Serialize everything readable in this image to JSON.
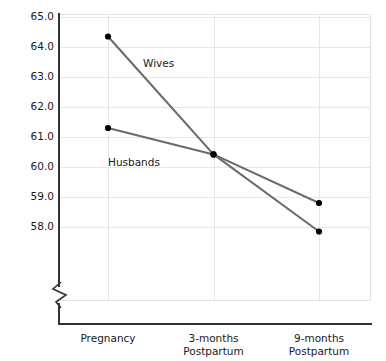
{
  "chart_data": {
    "type": "line",
    "title": "",
    "xlabel": "",
    "ylabel": "Mean Score:  Marital Satisfaction",
    "categories": [
      "Pregnancy",
      "3-months Postpartum",
      "9-months Postpartum"
    ],
    "category_lines": [
      [
        "Pregnancy",
        ""
      ],
      [
        "3-months",
        "Postpartum"
      ],
      [
        "9-months",
        "Postpartum"
      ]
    ],
    "ylim": [
      57.0,
      65.0
    ],
    "yticks": [
      65.0,
      64.0,
      63.0,
      62.0,
      61.0,
      60.0,
      59.0,
      58.0
    ],
    "ytick_labels": [
      "65.0",
      "64.0",
      "63.0",
      "62.0",
      "61.0",
      "60.0",
      "59.0",
      "58.0"
    ],
    "grid": true,
    "axis_break": true,
    "legend": "inline-labels",
    "series": [
      {
        "name": "Wives",
        "label": "Wives",
        "color": "#6b6b6b",
        "marker_color": "#000000",
        "values": [
          64.35,
          60.42,
          57.85
        ]
      },
      {
        "name": "Husbands",
        "label": "Husbands",
        "color": "#6b6b6b",
        "marker_color": "#000000",
        "values": [
          61.3,
          60.42,
          58.8
        ]
      }
    ]
  },
  "axis": {
    "y_title": "Mean Score:  Marital Satisfaction"
  }
}
